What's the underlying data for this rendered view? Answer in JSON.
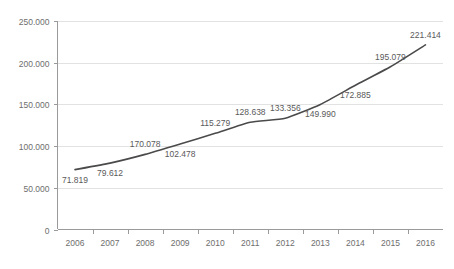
{
  "chart_data": {
    "type": "line",
    "title": "",
    "subtitle": "",
    "xlabel": "",
    "ylabel": "",
    "categories": [
      "2006",
      "2007",
      "2008",
      "2009",
      "2010",
      "2011",
      "2012",
      "2013",
      "2014",
      "2015",
      "2016"
    ],
    "values": [
      71819,
      79612,
      170078,
      102478,
      115279,
      128638,
      133356,
      149990,
      172885,
      195079,
      221414
    ],
    "point_labels": [
      "71.819",
      "79.612",
      "170.078",
      "102.478",
      "115.279",
      "128.638",
      "133.356",
      "149.990",
      "172.885",
      "195.079",
      "221.414"
    ],
    "plot_values": [
      71819,
      79612,
      90078,
      102478,
      115279,
      128638,
      133356,
      149990,
      172885,
      195079,
      221414
    ],
    "label_positions": [
      "below",
      "below",
      "above",
      "below",
      "above",
      "above",
      "above",
      "below",
      "below",
      "above",
      "above"
    ],
    "ylim": [
      0,
      250000
    ],
    "ytick_values": [
      0,
      50000,
      100000,
      150000,
      200000,
      250000
    ],
    "ytick_labels": [
      "0",
      "50.000",
      "100.000",
      "150.000",
      "200.000",
      "250.000"
    ],
    "grid": true,
    "grid_axis": "y",
    "legend": "none",
    "series_color": "#4a4a4a",
    "grid_color": "#e2e2e2",
    "axis_color": "#9a9a9a",
    "label_color": "#5a5a5a",
    "tick_label_color": "#6e6e6e",
    "background_color": "#ffffff",
    "series": [
      {
        "name": "series-1",
        "values": [
          71819,
          79612,
          170078,
          102478,
          115279,
          128638,
          133356,
          149990,
          172885,
          195079,
          221414
        ]
      }
    ]
  },
  "footer": {
    "cropped_caption": ""
  }
}
